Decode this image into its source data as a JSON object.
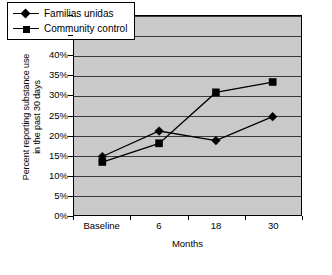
{
  "chart_data": {
    "type": "line",
    "title": "",
    "xlabel": "Months",
    "ylabel": "Percent reporting substance use in the past 30 days",
    "ylabel_line1": "Percent reporting substance use",
    "ylabel_line2": "in the past 30 days",
    "categories": [
      "Baseline",
      "6",
      "18",
      "30"
    ],
    "ylim": [
      0,
      50
    ],
    "ytick_labels": [
      "0%",
      "5%",
      "10%",
      "15%",
      "20%",
      "25%",
      "30%",
      "35%",
      "40%",
      "45%",
      "50%"
    ],
    "ytick_values": [
      0,
      5,
      10,
      15,
      20,
      25,
      30,
      35,
      40,
      45,
      50
    ],
    "grid": true,
    "legend_position": "top-left",
    "plot_background": "#c9c9c9",
    "series": [
      {
        "name": "Familias unidas",
        "marker": "diamond",
        "color": "#000000",
        "values": [
          14.7,
          21.1,
          18.7,
          24.7
        ]
      },
      {
        "name": "Community control",
        "marker": "square",
        "color": "#000000",
        "values": [
          13.3,
          18.0,
          30.8,
          33.4
        ]
      }
    ]
  }
}
